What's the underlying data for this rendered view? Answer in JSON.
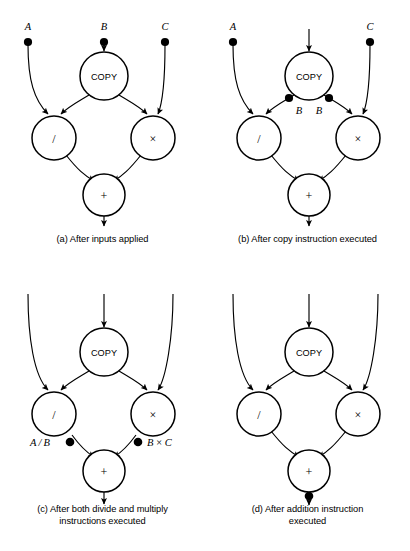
{
  "figure": {
    "type": "dataflow-graph-sequence"
  },
  "panels": [
    {
      "id": "a",
      "caption": "(a) After inputs applied",
      "caption_lines": [
        "(a) After inputs applied"
      ],
      "nodes": [
        {
          "name": "copy",
          "label": "COPY"
        },
        {
          "name": "divide",
          "label": "/"
        },
        {
          "name": "multiply",
          "label": "×"
        },
        {
          "name": "add",
          "label": "+"
        }
      ],
      "input_labels": [
        "A",
        "B",
        "C"
      ],
      "tokens": [
        "A",
        "B",
        "C"
      ],
      "token_labels": [],
      "output_label": ""
    },
    {
      "id": "b",
      "caption": "(b) After copy instruction executed",
      "caption_lines": [
        "(b) After copy instruction executed"
      ],
      "nodes": [
        {
          "name": "copy",
          "label": "COPY"
        },
        {
          "name": "divide",
          "label": "/"
        },
        {
          "name": "multiply",
          "label": "×"
        },
        {
          "name": "add",
          "label": "+"
        }
      ],
      "input_labels": [
        "A",
        "C"
      ],
      "tokens": [
        "A",
        "C",
        "B",
        "B"
      ],
      "token_labels": [
        "B",
        "B"
      ],
      "output_label": ""
    },
    {
      "id": "c",
      "caption": "(c) After both divide and multiply instructions executed",
      "caption_lines": [
        "(c) After both divide and multiply",
        "instructions executed"
      ],
      "nodes": [
        {
          "name": "copy",
          "label": "COPY"
        },
        {
          "name": "divide",
          "label": "/"
        },
        {
          "name": "multiply",
          "label": "×"
        },
        {
          "name": "add",
          "label": "+"
        }
      ],
      "input_labels": [],
      "tokens": [
        "A/B",
        "B×C"
      ],
      "token_labels": [
        "A / B",
        "B × C"
      ],
      "output_label": ""
    },
    {
      "id": "d",
      "caption": "(d) After addition instruction executed",
      "caption_lines": [
        "(d) After addition instruction",
        "executed"
      ],
      "nodes": [
        {
          "name": "copy",
          "label": "COPY"
        },
        {
          "name": "divide",
          "label": "/"
        },
        {
          "name": "multiply",
          "label": "×"
        },
        {
          "name": "add",
          "label": "+"
        }
      ],
      "input_labels": [],
      "tokens": [
        "A/B + B×C"
      ],
      "token_labels": [
        "A / B + B × C"
      ],
      "output_label": "A / B + B × C"
    }
  ],
  "colors": {
    "stroke": "#000000",
    "background": "#ffffff",
    "token_fill": "#000000"
  }
}
